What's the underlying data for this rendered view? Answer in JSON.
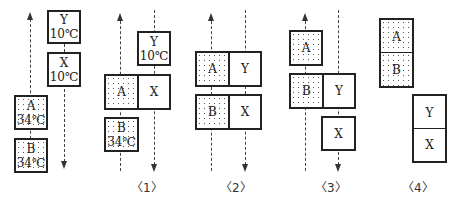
{
  "diagrams": [
    {
      "caption": "",
      "blocks": {
        "A": {
          "name": "A",
          "temp": "34℃",
          "pattern": "dotted"
        },
        "B": {
          "name": "B",
          "temp": "34℃",
          "pattern": "dotted"
        },
        "X": {
          "name": "X",
          "temp": "10℃",
          "pattern": "plain"
        },
        "Y": {
          "name": "Y",
          "temp": "10℃",
          "pattern": "plain"
        }
      },
      "flows": {
        "left": "up",
        "right": "down"
      }
    },
    {
      "caption": "〈1〉",
      "blocks": {
        "A": {
          "name": "A"
        },
        "B": {
          "name": "B",
          "temp": "34℃"
        },
        "X": {
          "name": "X"
        },
        "Y": {
          "name": "Y",
          "temp": "10℃"
        }
      },
      "flows": {
        "left": "up",
        "right": "down"
      }
    },
    {
      "caption": "〈2〉",
      "blocks": {
        "A": {
          "name": "A"
        },
        "B": {
          "name": "B"
        },
        "X": {
          "name": "X"
        },
        "Y": {
          "name": "Y"
        }
      },
      "flows": {
        "left": "up",
        "right": "down"
      }
    },
    {
      "caption": "〈3〉",
      "blocks": {
        "A": {
          "name": "A"
        },
        "B": {
          "name": "B"
        },
        "X": {
          "name": "X"
        },
        "Y": {
          "name": "Y"
        }
      },
      "flows": {
        "left": "up",
        "right": "down"
      }
    },
    {
      "caption": "〈4〉",
      "blocks": {
        "A": {
          "name": "A"
        },
        "B": {
          "name": "B"
        },
        "X": {
          "name": "X"
        },
        "Y": {
          "name": "Y"
        }
      },
      "flows": {}
    }
  ],
  "colors": {
    "stroke": "#222222",
    "dots": "#555555",
    "background": "#ffffff"
  }
}
